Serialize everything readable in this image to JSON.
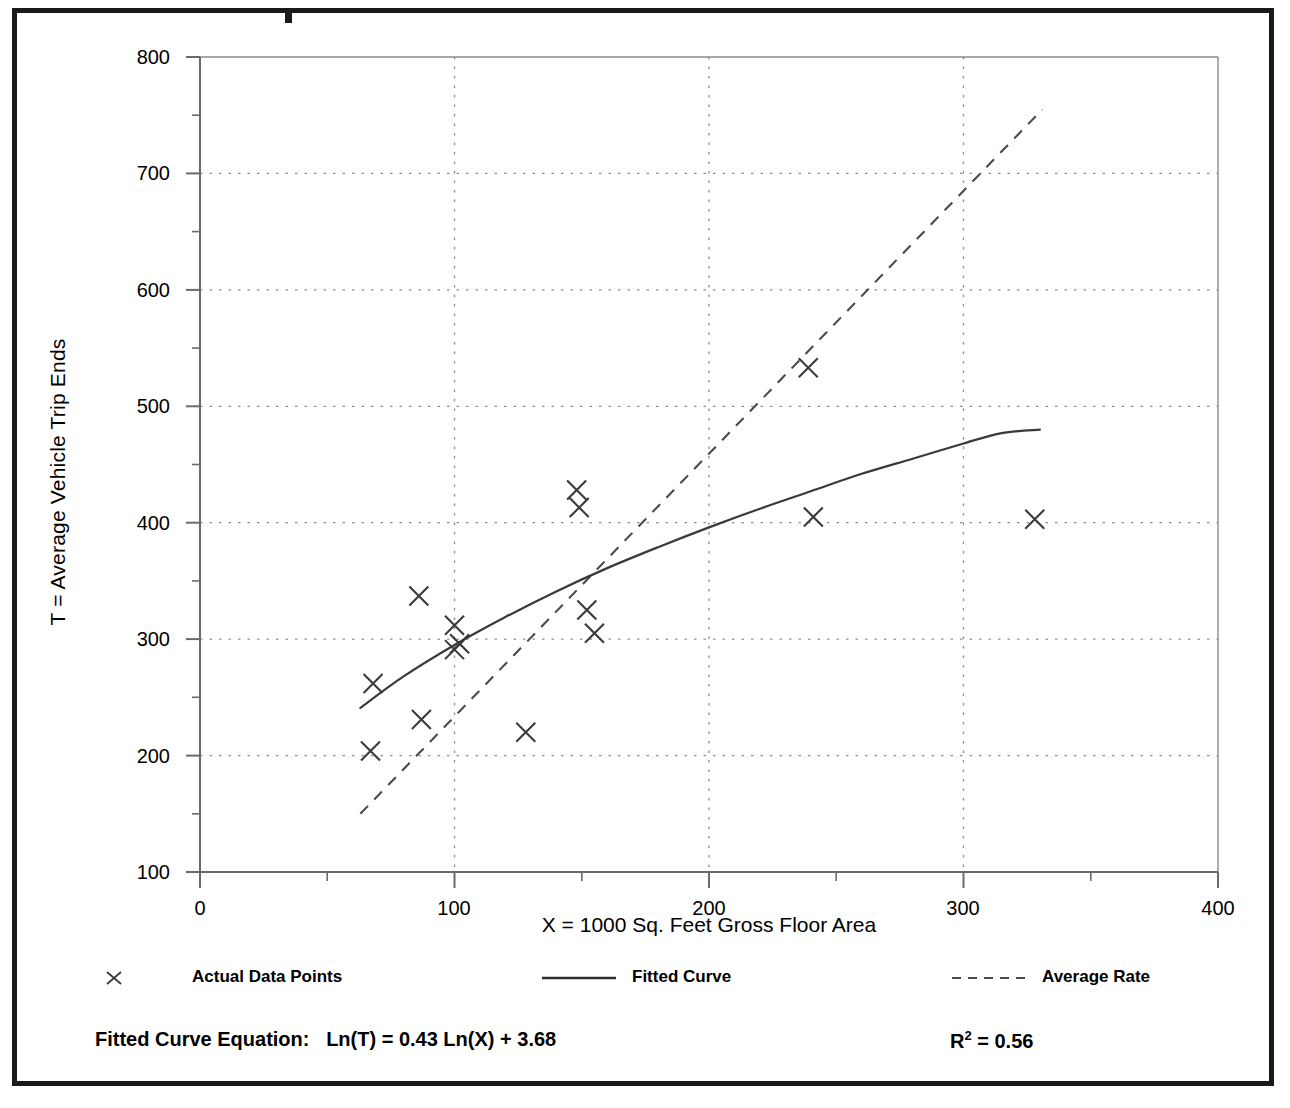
{
  "chart_data": {
    "type": "scatter",
    "title": "",
    "xlabel": "X = 1000 Sq. Feet Gross Floor Area",
    "ylabel": "T = Average Vehicle Trip Ends",
    "xlim": [
      0,
      400
    ],
    "ylim": [
      100,
      800
    ],
    "x_major_ticks": [
      0,
      100,
      200,
      300,
      400
    ],
    "x_minor_ticks": [
      50,
      150,
      250,
      350
    ],
    "y_major_ticks": [
      100,
      200,
      300,
      400,
      500,
      600,
      700,
      800
    ],
    "y_minor_ticks": [
      150,
      250,
      350,
      450,
      550,
      650,
      750
    ],
    "grid": "dotted gridlines at major ticks",
    "legend_position": "below-plot",
    "series": [
      {
        "name": "Actual Data Points",
        "type": "scatter",
        "marker": "x",
        "points": [
          {
            "x": 67,
            "y": 204
          },
          {
            "x": 68,
            "y": 262
          },
          {
            "x": 86,
            "y": 337
          },
          {
            "x": 87,
            "y": 231
          },
          {
            "x": 100,
            "y": 312
          },
          {
            "x": 100,
            "y": 291
          },
          {
            "x": 102,
            "y": 296
          },
          {
            "x": 128,
            "y": 220
          },
          {
            "x": 148,
            "y": 428
          },
          {
            "x": 149,
            "y": 413
          },
          {
            "x": 152,
            "y": 325
          },
          {
            "x": 155,
            "y": 305
          },
          {
            "x": 239,
            "y": 533
          },
          {
            "x": 241,
            "y": 405
          },
          {
            "x": 328,
            "y": 403
          }
        ]
      },
      {
        "name": "Fitted Curve",
        "type": "line",
        "style": "solid",
        "equation": "Ln(T) = 0.43 Ln(X) + 3.68",
        "x_range": [
          63,
          330
        ],
        "points": [
          {
            "x": 63,
            "y": 241
          },
          {
            "x": 80,
            "y": 268
          },
          {
            "x": 100,
            "y": 295
          },
          {
            "x": 120,
            "y": 319
          },
          {
            "x": 140,
            "y": 341
          },
          {
            "x": 160,
            "y": 361
          },
          {
            "x": 180,
            "y": 379
          },
          {
            "x": 200,
            "y": 396
          },
          {
            "x": 220,
            "y": 412
          },
          {
            "x": 240,
            "y": 427
          },
          {
            "x": 260,
            "y": 442
          },
          {
            "x": 280,
            "y": 455
          },
          {
            "x": 300,
            "y": 468
          },
          {
            "x": 315,
            "y": 477
          },
          {
            "x": 330,
            "y": 480
          }
        ]
      },
      {
        "name": "Average Rate",
        "type": "line",
        "style": "dashed",
        "points": [
          {
            "x": 63,
            "y": 150
          },
          {
            "x": 331,
            "y": 755
          }
        ]
      }
    ]
  },
  "axes": {
    "y_tick_labels": [
      "800",
      "700",
      "600",
      "500",
      "400",
      "300",
      "200",
      "100"
    ],
    "x_tick_labels": [
      "0",
      "100",
      "200",
      "300",
      "400"
    ],
    "y_title": "T = Average Vehicle Trip Ends",
    "x_title": "X = 1000 Sq. Feet Gross Floor Area"
  },
  "legend": {
    "entries": [
      {
        "label": "Actual Data Points",
        "marker": "x-marker"
      },
      {
        "label": "Fitted Curve",
        "marker": "solid-line"
      },
      {
        "label": "Average Rate",
        "marker": "dashed-line"
      }
    ]
  },
  "footer": {
    "equation_label": "Fitted Curve Equation:",
    "equation_value": "Ln(T) = 0.43 Ln(X) + 3.68",
    "r2_label": "R",
    "r2_exponent": "2",
    "r2_value": "= 0.56"
  },
  "colors": {
    "frame": "#1a1a1a",
    "axis": "#6b6b6b",
    "grid": "#909090",
    "data": "#3a3a3a",
    "background": "#ffffff"
  }
}
